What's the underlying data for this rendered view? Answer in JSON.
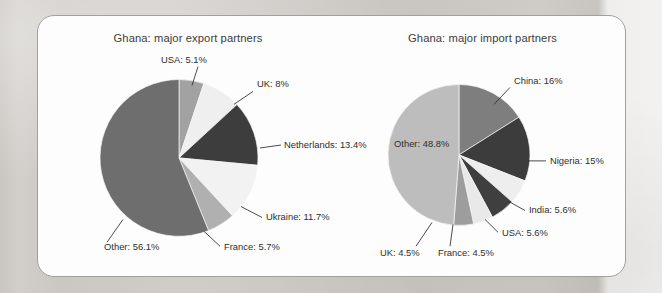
{
  "page": {
    "background_color": "#cfccc8",
    "card_background": "#fdfdfd",
    "card_border_color": "#a3a09c"
  },
  "chart_data": [
    {
      "type": "pie",
      "id": "export-pie",
      "title": "Ghana: major export partners",
      "categories": [
        "USA",
        "UK",
        "Netherlands",
        "Ukraine",
        "France",
        "Other"
      ],
      "values": [
        5.1,
        8,
        13.4,
        11.7,
        5.7,
        56.1
      ],
      "labels": [
        "USA: 5.1%",
        "UK: 8%",
        "Netherlands: 13.4%",
        "Ukraine: 11.7%",
        "France: 5.7%",
        "Other: 56.1%"
      ],
      "colors": [
        "#a2a2a2",
        "#efefef",
        "#3d3d3d",
        "#f2f2f2",
        "#b0b0b0",
        "#6e6e6e"
      ],
      "start_angle_deg": 0,
      "direction": "clockwise",
      "legend": "leader-line labels",
      "xlabel": "",
      "ylabel": ""
    },
    {
      "type": "pie",
      "id": "import-pie",
      "title": "Ghana: major import partners",
      "categories": [
        "China",
        "Nigeria",
        "India",
        "USA",
        "France",
        "UK",
        "Other"
      ],
      "values": [
        16,
        15,
        5.6,
        5.6,
        4.5,
        4.5,
        48.8
      ],
      "labels": [
        "China: 16%",
        "Nigeria: 15%",
        "India: 5.6%",
        "USA: 5.6%",
        "France: 4.5%",
        "UK: 4.5%",
        "Other: 48.8%"
      ],
      "colors": [
        "#7e7e7e",
        "#3c3c3c",
        "#eeeeee",
        "#3f3f3f",
        "#e9e9e9",
        "#9d9d9d",
        "#bdbdbd"
      ],
      "start_angle_deg": 0,
      "direction": "clockwise",
      "legend": "leader-line labels",
      "xlabel": "",
      "ylabel": ""
    }
  ],
  "export_chart": {
    "title": "Ghana: major export partners",
    "center": {
      "x": 141,
      "y": 143
    },
    "radius": 79,
    "slices": [
      {
        "label": "USA: 5.1%",
        "value": 5.1,
        "color": "#a2a2a2",
        "leader": {
          "x1": 154,
          "y1": 70,
          "x2": 160,
          "y2": 51
        },
        "text": {
          "x": 123,
          "y": 47,
          "anchor": "start"
        }
      },
      {
        "label": "UK: 8%",
        "value": 8,
        "color": "#efefef",
        "leader": {
          "x1": 196,
          "y1": 89,
          "x2": 215,
          "y2": 76
        },
        "text": {
          "x": 219,
          "y": 72,
          "anchor": "start"
        }
      },
      {
        "label": "Netherlands: 13.4%",
        "value": 13.4,
        "color": "#3d3d3d",
        "leader": {
          "x1": 222,
          "y1": 133,
          "x2": 243,
          "y2": 130
        },
        "text": {
          "x": 246,
          "y": 133,
          "anchor": "start"
        }
      },
      {
        "label": "Ukraine: 11.7%",
        "value": 11.7,
        "color": "#f2f2f2",
        "leader": {
          "x1": 203,
          "y1": 192,
          "x2": 224,
          "y2": 203
        },
        "text": {
          "x": 228,
          "y": 206,
          "anchor": "start"
        }
      },
      {
        "label": "France: 5.7%",
        "value": 5.7,
        "color": "#b0b0b0",
        "leader": {
          "x1": 166,
          "y1": 217,
          "x2": 182,
          "y2": 232
        },
        "text": {
          "x": 186,
          "y": 236,
          "anchor": "start"
        }
      },
      {
        "label": "Other: 56.1%",
        "value": 56.1,
        "color": "#6e6e6e",
        "leader": {
          "x1": 85,
          "y1": 205,
          "x2": 69,
          "y2": 228
        },
        "text": {
          "x": 66,
          "y": 236,
          "anchor": "end"
        }
      }
    ]
  },
  "import_chart": {
    "title": "Ghana: major import partners",
    "center": {
      "x": 121,
      "y": 140
    },
    "radius": 71,
    "slices": [
      {
        "label": "China: 16%",
        "value": 16,
        "color": "#7e7e7e",
        "leader": {
          "x1": 156,
          "y1": 89,
          "x2": 172,
          "y2": 72
        },
        "text": {
          "x": 176,
          "y": 69,
          "anchor": "start"
        }
      },
      {
        "label": "Nigeria: 15%",
        "value": 15,
        "color": "#3c3c3c",
        "leader": {
          "x1": 190,
          "y1": 146,
          "x2": 208,
          "y2": 146
        },
        "text": {
          "x": 212,
          "y": 149,
          "anchor": "start"
        }
      },
      {
        "label": "India: 5.6%",
        "value": 5.6,
        "color": "#eeeeee",
        "leader": {
          "x1": 171,
          "y1": 187,
          "x2": 187,
          "y2": 196
        },
        "text": {
          "x": 191,
          "y": 199,
          "anchor": "start"
        }
      },
      {
        "label": "USA: 5.6%",
        "value": 5.6,
        "color": "#3f3f3f",
        "leader": {
          "x1": 147,
          "y1": 205,
          "x2": 160,
          "y2": 218
        },
        "text": {
          "x": 164,
          "y": 222,
          "anchor": "start"
        }
      },
      {
        "label": "France: 4.5%",
        "value": 4.5,
        "color": "#e9e9e9",
        "leader": {
          "x1": 115,
          "y1": 210,
          "x2": 112,
          "y2": 232
        },
        "text": {
          "x": 100,
          "y": 242,
          "anchor": "start"
        }
      },
      {
        "label": "UK: 4.5%",
        "value": 4.5,
        "color": "#9d9d9d",
        "leader": {
          "x1": 94,
          "y1": 208,
          "x2": 78,
          "y2": 232
        },
        "text": {
          "x": 42,
          "y": 242,
          "anchor": "start"
        }
      },
      {
        "label": "Other: 48.8%",
        "value": 48.8,
        "color": "#bdbdbd",
        "leader": null,
        "text": {
          "x": 56,
          "y": 132,
          "anchor": "start"
        }
      }
    ]
  }
}
